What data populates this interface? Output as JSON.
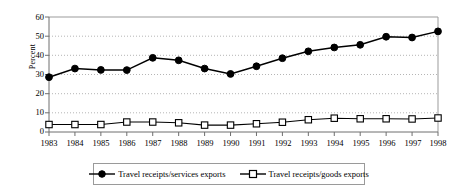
{
  "chart_data": {
    "type": "line",
    "title": "",
    "subtitle": "",
    "xlabel": "",
    "ylabel": "Percent",
    "categories": [
      "1983",
      "1984",
      "1985",
      "1986",
      "1987",
      "1988",
      "1989",
      "1990",
      "1991",
      "1992",
      "1993",
      "1994",
      "1995",
      "1996",
      "1997",
      "1998"
    ],
    "x": [
      1983,
      1984,
      1985,
      1986,
      1987,
      1988,
      1989,
      1990,
      1991,
      1992,
      1993,
      1994,
      1995,
      1996,
      1997,
      1998
    ],
    "xlim": [
      1983,
      1998
    ],
    "ylim": [
      0,
      60
    ],
    "yticks": [
      0,
      10,
      20,
      30,
      40,
      50,
      60
    ],
    "ytick_labels": [
      "0",
      "10",
      "20",
      "30",
      "40",
      "50",
      "60"
    ],
    "grid": "horizontal-dotted",
    "legend_position": "bottom",
    "series": [
      {
        "name": "Travel receipts/services exports",
        "marker": "filled-circle",
        "color": "#000000",
        "values": [
          28.6,
          33.1,
          32.4,
          32.3,
          38.7,
          37.4,
          33.1,
          30.3,
          34.3,
          38.5,
          42.1,
          44.1,
          45.5,
          49.7,
          49.3,
          52.5
        ]
      },
      {
        "name": "Travel receipts/goods exports",
        "marker": "open-square",
        "color": "#000000",
        "values": [
          3.9,
          3.9,
          3.9,
          5.2,
          5.2,
          4.8,
          3.6,
          3.6,
          4.3,
          5.1,
          6.4,
          7.2,
          6.9,
          6.9,
          6.8,
          7.3
        ]
      }
    ]
  },
  "legend": {
    "entries": [
      {
        "label": "Travel receipts/services exports",
        "marker_name": "filled-circle-marker"
      },
      {
        "label": "Travel receipts/goods exports",
        "marker_name": "open-square-marker"
      }
    ]
  },
  "colors": {
    "series_line": "#000000",
    "axis": "#808080",
    "grid": "#b5b5b5",
    "legend_border": "#9a9a9a",
    "background": "#ffffff"
  }
}
